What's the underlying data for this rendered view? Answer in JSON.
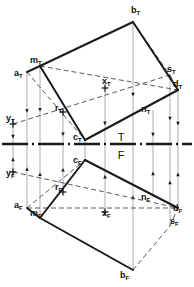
{
  "drawing": {
    "title": "Orthographic two-view projection with top (T) and front (F) views",
    "fold_line": {
      "top_label": "T",
      "bottom_label": "F",
      "y": 144
    },
    "colors": {
      "ink": "#1a1a1a",
      "thin": "#8a8a8a",
      "dash": "#5a5a5a",
      "background": "#ffffff"
    }
  },
  "labels": [
    {
      "id": "b_T",
      "base": "b",
      "sub": "T",
      "x": 131,
      "y": 13
    },
    {
      "id": "m_T",
      "base": "m",
      "sub": "T",
      "x": 30,
      "y": 63
    },
    {
      "id": "a_T",
      "base": "a",
      "sub": "T",
      "x": 14,
      "y": 76
    },
    {
      "id": "s_T",
      "base": "s",
      "sub": "T",
      "x": 167,
      "y": 72
    },
    {
      "id": "d_T",
      "base": "d",
      "sub": "T",
      "x": 173,
      "y": 87
    },
    {
      "id": "x_T",
      "base": "x",
      "sub": "T",
      "x": 102,
      "y": 84
    },
    {
      "id": "r_T",
      "base": "r",
      "sub": "T",
      "x": 55,
      "y": 111
    },
    {
      "id": "n_T",
      "base": "n",
      "sub": "T",
      "x": 141,
      "y": 112
    },
    {
      "id": "y_T",
      "base": "y",
      "sub": "T",
      "x": 6,
      "y": 121
    },
    {
      "id": "c_T",
      "base": "c",
      "sub": "T",
      "x": 73,
      "y": 140
    },
    {
      "id": "c_F",
      "base": "c",
      "sub": "F",
      "x": 73,
      "y": 163
    },
    {
      "id": "y_F",
      "base": "y",
      "sub": "F",
      "x": 6,
      "y": 176
    },
    {
      "id": "r_F",
      "base": "r",
      "sub": "F",
      "x": 55,
      "y": 190
    },
    {
      "id": "n_F",
      "base": "n",
      "sub": "F",
      "x": 141,
      "y": 200
    },
    {
      "id": "a_F",
      "base": "a",
      "sub": "F",
      "x": 14,
      "y": 208
    },
    {
      "id": "m_F",
      "base": "m",
      "sub": "F",
      "x": 30,
      "y": 216
    },
    {
      "id": "x_F",
      "base": "x",
      "sub": "F",
      "x": 102,
      "y": 216
    },
    {
      "id": "d_F",
      "base": "d",
      "sub": "F",
      "x": 173,
      "y": 211
    },
    {
      "id": "s_F",
      "base": "s",
      "sub": "F",
      "x": 170,
      "y": 224
    },
    {
      "id": "b_F",
      "base": "b",
      "sub": "F",
      "x": 120,
      "y": 278
    }
  ],
  "points": {
    "aT": [
      27,
      72
    ],
    "mT": [
      40,
      66
    ],
    "bT": [
      133,
      22
    ],
    "sT": [
      170,
      75
    ],
    "dT": [
      178,
      90
    ],
    "nT": [
      153,
      110
    ],
    "xT": [
      105,
      88
    ],
    "rT": [
      63,
      112
    ],
    "yT": [
      13,
      124
    ],
    "cT": [
      85,
      140
    ],
    "cF": [
      85,
      160
    ],
    "rF": [
      63,
      192
    ],
    "yF": [
      13,
      172
    ],
    "aF": [
      27,
      208
    ],
    "mF": [
      40,
      218
    ],
    "xF": [
      105,
      212
    ],
    "nF": [
      153,
      198
    ],
    "dF": [
      178,
      208
    ],
    "sF": [
      170,
      226
    ],
    "bF": [
      133,
      270
    ]
  },
  "solid_edges": [
    {
      "name": "edge-mT-bT",
      "from": "mT",
      "to": "bT"
    },
    {
      "name": "edge-bT-dT",
      "from": "bT",
      "to": "dT"
    },
    {
      "name": "edge-dT-cT",
      "from": "dT",
      "to": "cT"
    },
    {
      "name": "edge-cT-mT",
      "from": "cT",
      "to": "mT"
    },
    {
      "name": "edge-aT-mT",
      "from": "aT",
      "to": "mT"
    },
    {
      "name": "edge-cF-dF",
      "from": "cF",
      "to": "dF"
    },
    {
      "name": "edge-cF-mF",
      "from": "cF",
      "to": "mF"
    },
    {
      "name": "edge-mF-bF",
      "from": "mF",
      "to": "bF"
    },
    {
      "name": "edge-aF-mF",
      "from": "aF",
      "to": "mF"
    }
  ],
  "dashed_edges": [
    {
      "name": "dash-bT-sT",
      "from": "bT",
      "to": "sT"
    },
    {
      "name": "dash-sT-dT",
      "from": "sT",
      "to": "dT"
    },
    {
      "name": "dash-mT-dT",
      "from": "mT",
      "to": "dT"
    },
    {
      "name": "dash-aT-cT",
      "from": "aT",
      "to": "cT"
    },
    {
      "name": "dash-yT-sT",
      "from": "yT",
      "to": "sT"
    },
    {
      "name": "dash-aF-cF",
      "from": "aF",
      "to": "cF"
    },
    {
      "name": "dash-yF-dF",
      "from": "yF",
      "to": "dF"
    },
    {
      "name": "dash-aF-dF",
      "from": "aF",
      "to": "dF"
    },
    {
      "name": "dash-bF-sF",
      "from": "bF",
      "to": "sF"
    },
    {
      "name": "dash-sF-dF",
      "from": "sF",
      "to": "dF"
    }
  ],
  "projectors": [
    {
      "name": "projector-a",
      "x": 27,
      "y1": 72,
      "y2": 208
    },
    {
      "name": "projector-m",
      "x": 40,
      "y1": 66,
      "y2": 218
    },
    {
      "name": "projector-r",
      "x": 63,
      "y1": 112,
      "y2": 192
    },
    {
      "name": "projector-c",
      "x": 85,
      "y1": 140,
      "y2": 160
    },
    {
      "name": "projector-x",
      "x": 105,
      "y1": 88,
      "y2": 212
    },
    {
      "name": "projector-b",
      "x": 133,
      "y1": 22,
      "y2": 270
    },
    {
      "name": "projector-n",
      "x": 153,
      "y1": 110,
      "y2": 198
    },
    {
      "name": "projector-s",
      "x": 170,
      "y1": 75,
      "y2": 226
    },
    {
      "name": "projector-d",
      "x": 178,
      "y1": 90,
      "y2": 208
    },
    {
      "name": "projector-y",
      "x": 13,
      "y1": 124,
      "y2": 172
    }
  ],
  "crosshairs": [
    {
      "name": "crosshair-xT",
      "x": 105,
      "y": 88
    },
    {
      "name": "crosshair-xF",
      "x": 105,
      "y": 212
    },
    {
      "name": "crosshair-yT",
      "x": 13,
      "y": 124
    },
    {
      "name": "crosshair-yF",
      "x": 13,
      "y": 172
    },
    {
      "name": "crosshair-rT",
      "x": 63,
      "y": 112
    },
    {
      "name": "crosshair-rF",
      "x": 63,
      "y": 192
    }
  ]
}
